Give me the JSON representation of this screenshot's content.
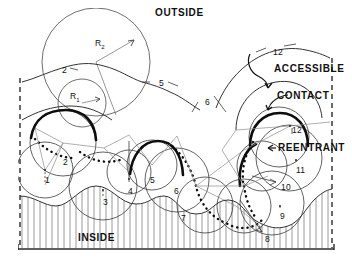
{
  "figure": {
    "title_outside": "OUTSIDE",
    "title_inside": "INSIDE",
    "region_labels": {
      "accessible": "ACCESSIBLE",
      "contact": "CONTACT",
      "reentrant": "REENTRANT"
    },
    "radius_labels": {
      "r_small": "R",
      "r_small_sub": "1",
      "r_large": "R",
      "r_large_sub": "2"
    },
    "atom_numbers": [
      {
        "id": "n-top-2",
        "text": "2",
        "x": 62,
        "y": 66
      },
      {
        "id": "n-top-5",
        "text": "5",
        "x": 159,
        "y": 79
      },
      {
        "id": "n-top-6",
        "text": "6",
        "x": 205,
        "y": 98
      },
      {
        "id": "n-top-12",
        "text": "12",
        "x": 273,
        "y": 48
      },
      {
        "id": "n-mid-12",
        "text": "12",
        "x": 292,
        "y": 126
      },
      {
        "id": "n-c2",
        "text": "2",
        "x": 63,
        "y": 158
      },
      {
        "id": "n-c1",
        "text": "1",
        "x": 45,
        "y": 176
      },
      {
        "id": "n-c3",
        "text": "3",
        "x": 103,
        "y": 198
      },
      {
        "id": "n-c4",
        "text": "4",
        "x": 128,
        "y": 187
      },
      {
        "id": "n-c5",
        "text": "5",
        "x": 150,
        "y": 176
      },
      {
        "id": "n-c6",
        "text": "6",
        "x": 174,
        "y": 187
      },
      {
        "id": "n-c7",
        "text": "7",
        "x": 181,
        "y": 214
      },
      {
        "id": "n-c8",
        "text": "8",
        "x": 265,
        "y": 235
      },
      {
        "id": "n-c9",
        "text": "9",
        "x": 280,
        "y": 212
      },
      {
        "id": "n-c10",
        "text": "10",
        "x": 281,
        "y": 183
      },
      {
        "id": "n-c11",
        "text": "11",
        "x": 296,
        "y": 166
      }
    ],
    "colors": {
      "ink": "#111111",
      "thin": "#6b6b6b",
      "hatch": "#9a9a9a",
      "frame": "#2b2b2b",
      "background": "#ffffff"
    },
    "surface_types": {
      "accessible_style": "thin-solid-arc",
      "contact_style": "thick-solid-arc",
      "reentrant_style": "dotted-arc",
      "probe_style": "thin-circle"
    }
  }
}
